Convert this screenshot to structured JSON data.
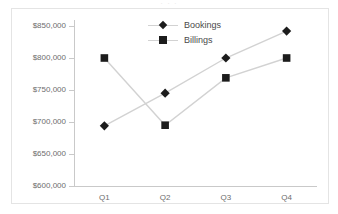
{
  "title_remnant": "· · ·",
  "legend": {
    "position": "top-center",
    "entries": [
      {
        "label": "Bookings",
        "marker": "diamond-marker-icon",
        "color": "#1c1c1c"
      },
      {
        "label": "Billings",
        "marker": "square-marker-icon",
        "color": "#1c1c1c"
      }
    ]
  },
  "axes": {
    "y_tick_labels": [
      "$850,000",
      "$800,000",
      "$750,000",
      "$700,000",
      "$650,000",
      "$600,000"
    ],
    "x_tick_labels": [
      "Q1",
      "Q2",
      "Q3",
      "Q4"
    ]
  },
  "colors": {
    "marker": "#1c1c1c",
    "line": "#d2d2d2",
    "axis": "#c9c9c9",
    "frame": "#e4e4e4",
    "label_text": "#6d6d6d",
    "legend_text": "#4a4a4a",
    "background": "#ffffff"
  },
  "chart_data": {
    "type": "line",
    "title": "",
    "subtitle": "",
    "xlabel": "",
    "ylabel": "",
    "categories": [
      "Q1",
      "Q2",
      "Q3",
      "Q4"
    ],
    "series": [
      {
        "name": "Bookings",
        "marker": "diamond",
        "values": [
          694000,
          745000,
          800000,
          842000
        ]
      },
      {
        "name": "Billings",
        "marker": "square",
        "values": [
          800000,
          695000,
          769000,
          800000
        ]
      }
    ],
    "ylim": [
      600000,
      850000
    ],
    "ytick_step": 50000,
    "ytick_values": [
      600000,
      650000,
      700000,
      750000,
      800000,
      850000
    ],
    "yticklabels": [
      "$600,000",
      "$650,000",
      "$700,000",
      "$750,000",
      "$800,000",
      "$850,000"
    ],
    "grid": false,
    "legend_position": "top-center",
    "value_prefix": "$"
  }
}
